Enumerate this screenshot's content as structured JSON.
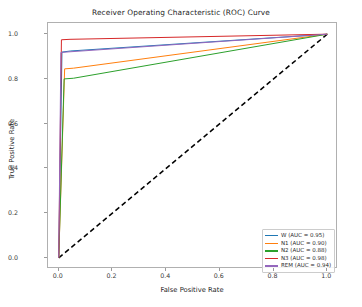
{
  "chart_data": {
    "type": "line",
    "title": "Receiver Operating Characteristic (ROC) Curve",
    "xlabel": "False Positive Rate",
    "ylabel": "True Positive Rate",
    "xlim": [
      -0.04,
      1.04
    ],
    "ylim": [
      -0.05,
      1.05
    ],
    "xticks": [
      "0.0",
      "0.2",
      "0.4",
      "0.6",
      "0.8",
      "1.0"
    ],
    "xtick_values": [
      0.0,
      0.2,
      0.4,
      0.6,
      0.8,
      1.0
    ],
    "yticks": [
      "0.0",
      "0.2",
      "0.4",
      "0.6",
      "0.8",
      "1.0"
    ],
    "ytick_values": [
      0.0,
      0.2,
      0.4,
      0.6,
      0.8,
      1.0
    ],
    "grid": false,
    "legend_position": "lower right",
    "reference_line": {
      "name": "chance-diagonal",
      "x": [
        0.0,
        1.0
      ],
      "y": [
        0.0,
        1.0
      ],
      "color": "#000000",
      "style": "dashed"
    },
    "series": [
      {
        "name": "W",
        "label": "W (AUC = 0.95)",
        "auc": 0.95,
        "color": "#1f77b4",
        "x": [
          0.0,
          0.012,
          0.045,
          1.0
        ],
        "y": [
          0.0,
          0.92,
          0.925,
          1.0
        ]
      },
      {
        "name": "N1",
        "label": "N1 (AUC = 0.90)",
        "auc": 0.9,
        "color": "#ff7f0e",
        "x": [
          0.0,
          0.022,
          0.055,
          1.0
        ],
        "y": [
          0.0,
          0.845,
          0.848,
          1.0
        ]
      },
      {
        "name": "N2",
        "label": "N2 (AUC = 0.88)",
        "auc": 0.88,
        "color": "#2ca02c",
        "x": [
          0.0,
          0.02,
          0.055,
          1.0
        ],
        "y": [
          0.0,
          0.8,
          0.803,
          1.0
        ]
      },
      {
        "name": "N3",
        "label": "N3 (AUC = 0.98)",
        "auc": 0.98,
        "color": "#d62728",
        "x": [
          0.0,
          0.01,
          0.042,
          1.0
        ],
        "y": [
          0.0,
          0.975,
          0.977,
          1.0
        ]
      },
      {
        "name": "REM",
        "label": "REM (AUC = 0.94)",
        "auc": 0.94,
        "color": "#9467bd",
        "x": [
          0.0,
          0.008,
          0.038,
          1.0
        ],
        "y": [
          0.0,
          0.918,
          0.921,
          1.0
        ]
      }
    ]
  }
}
